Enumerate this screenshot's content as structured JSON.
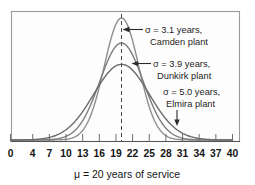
{
  "chart_data": {
    "type": "line",
    "title": "",
    "subtitle": "",
    "xlabel": "μ  =  20 years of service",
    "ylabel": "",
    "xlim": [
      0,
      40
    ],
    "ylim": [
      0,
      0.135
    ],
    "grid": false,
    "legend_position": "inline-annotations",
    "x_ticks": [
      0,
      4,
      7,
      10,
      13,
      16,
      19,
      22,
      25,
      28,
      31,
      34,
      37,
      40
    ],
    "x_tick_labels": [
      "0",
      "4",
      "7",
      "10",
      "13",
      "16",
      "19",
      "22",
      "25",
      "28",
      "31",
      "34",
      "37",
      "40"
    ],
    "mean": 20,
    "mean_marker": {
      "value": 20,
      "style": "dashed-vertical"
    },
    "series": [
      {
        "name": "Camden plant",
        "sigma": 3.1,
        "mu": 20,
        "color": "#8e8e8e",
        "peak_height": 0.1287
      },
      {
        "name": "Dunkirk plant",
        "sigma": 3.9,
        "mu": 20,
        "color": "#7d7d7d",
        "peak_height": 0.1023
      },
      {
        "name": "Elmira plant",
        "sigma": 5.0,
        "mu": 20,
        "color": "#6b6b6b",
        "peak_height": 0.0798
      }
    ],
    "annotations": [
      {
        "id": "camden",
        "line1": "σ  =  3.1 years,",
        "line2": "Camden plant",
        "arrow": "left"
      },
      {
        "id": "dunkirk",
        "line1": "σ  =  3.9 years,",
        "line2": "Dunkirk plant",
        "arrow": "left"
      },
      {
        "id": "elmira",
        "line1": "σ  =  5.0 years,",
        "line2": "Elmira plant",
        "arrow": "down"
      }
    ]
  },
  "colors": {
    "frame_stroke": "#9a9a9a",
    "frame_fill": "#fdfdfd",
    "axis": "#555555",
    "text": "#151515",
    "mean_line": "#4a4a4a"
  }
}
